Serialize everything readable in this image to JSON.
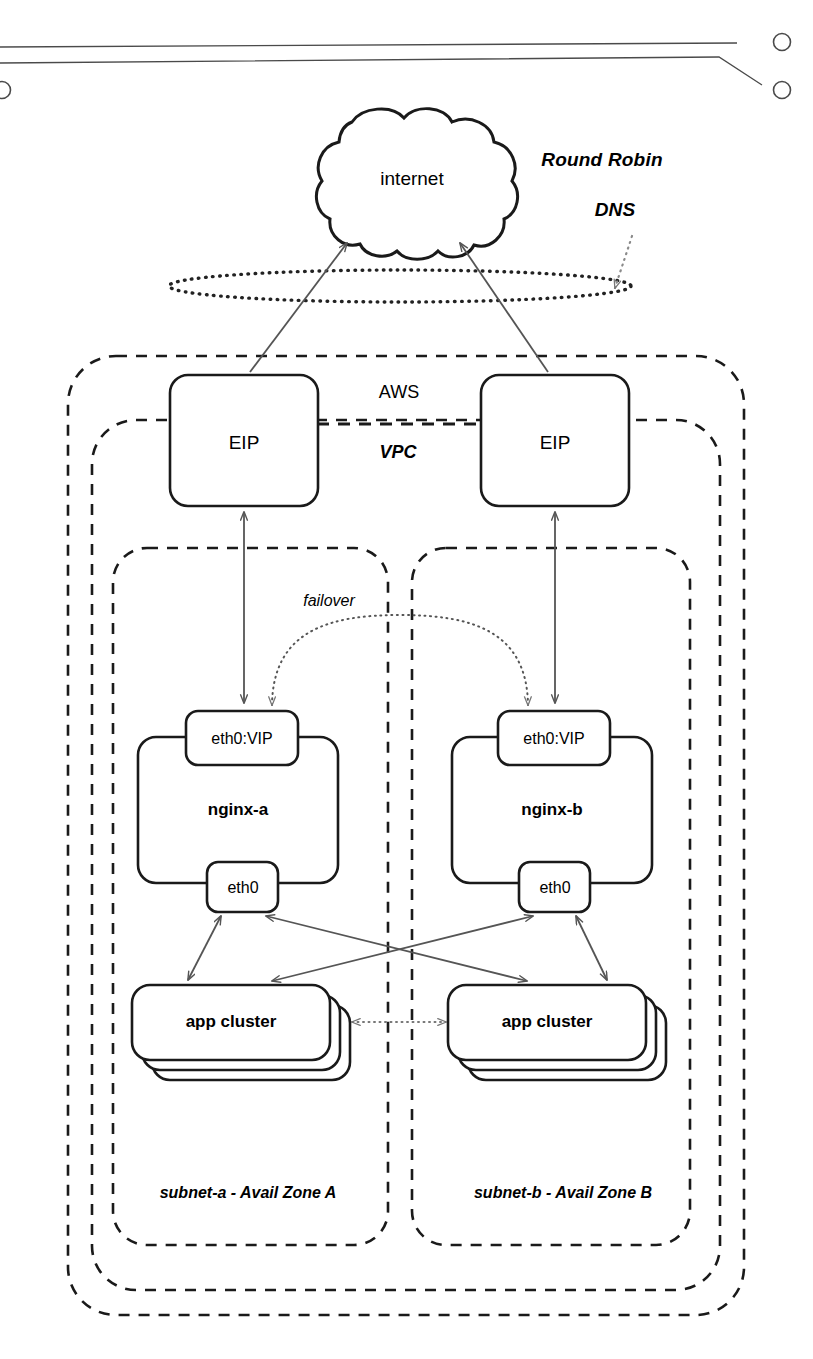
{
  "diagram": {
    "colors": {
      "stroke": "#1a1a1a",
      "arrow": "#555555",
      "dotted": "#222222",
      "background": "#ffffff"
    },
    "page_artifact": {
      "name": "scanned-page-edge",
      "description": "spiral-binding holes and page edge lines at top of scan"
    },
    "cloud": {
      "label": "internet"
    },
    "annotations": {
      "round_robin_dns": "Round Robin\nDNS",
      "round_robin_dns_line1": "Round Robin",
      "round_robin_dns_line2": "DNS",
      "failover": "failover"
    },
    "boundaries": [
      {
        "id": "aws",
        "label": "AWS",
        "style": "dashed"
      },
      {
        "id": "vpc",
        "label": "VPC",
        "style": "dashed"
      },
      {
        "id": "subnet-a",
        "label": "subnet-a - Avail Zone A",
        "style": "dashed"
      },
      {
        "id": "subnet-b",
        "label": "subnet-b - Avail Zone B",
        "style": "dashed"
      }
    ],
    "zones": [
      {
        "id": "a",
        "subnet_label": "subnet-a - Avail Zone A",
        "eip_label": "EIP",
        "vip_label": "eth0:VIP",
        "host_label": "nginx-a",
        "nic_label": "eth0",
        "app_label": "app cluster"
      },
      {
        "id": "b",
        "subnet_label": "subnet-b - Avail Zone B",
        "eip_label": "EIP",
        "vip_label": "eth0:VIP",
        "host_label": "nginx-b",
        "nic_label": "eth0",
        "app_label": "app cluster"
      }
    ]
  }
}
